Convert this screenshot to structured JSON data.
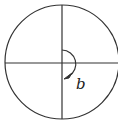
{
  "diagram": {
    "type": "unit-circle-angle",
    "angle_label": "b",
    "angle_direction": "clockwise",
    "angle_start": "positive y-axis",
    "angle_end": "negative y-axis",
    "stroke_color": "#333333",
    "background": "#ffffff"
  }
}
